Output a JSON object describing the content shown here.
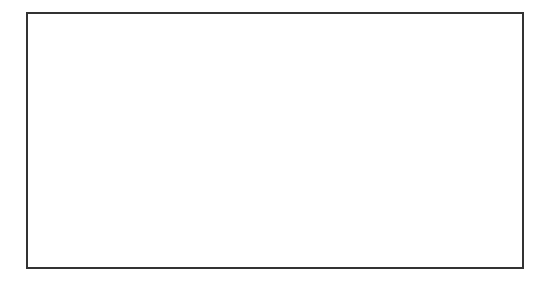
{
  "viewport": {
    "name": "3d-perspective-viewport",
    "frame": {
      "x": 27,
      "y": 13,
      "w": 496,
      "h": 255,
      "border_color": "#333333"
    },
    "colors": {
      "background": "#ffffff",
      "grid_minor": "#d4d4d4",
      "grid_major": "#6e6e6e",
      "mesh_top": "#8c8c8c",
      "mesh_side": "#7a7a7a",
      "mesh_side_dark": "#3a3a3a",
      "edge": "#5a5a5a",
      "vertex": "#1a1a1a"
    }
  },
  "mesh": {
    "name": "L-shaped extruded slab with rounded corner",
    "vertices_top": {
      "left_outer": [
        73,
        136
      ],
      "left_back": [
        180,
        75
      ],
      "pivot": [
        258,
        107
      ],
      "right_back": [
        330,
        54
      ],
      "right_outer": [
        448,
        92
      ],
      "arc_start": [
        155,
        180
      ],
      "arc_end": [
        385,
        150
      ]
    },
    "arc_segments": 14,
    "thickness": 12
  },
  "pivot_gizmo": {
    "icon": "pivot-gizmo-icon",
    "x": 259,
    "y": 127
  }
}
